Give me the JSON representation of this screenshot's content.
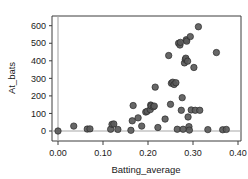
{
  "chart_data": {
    "type": "scatter",
    "title": "",
    "xlabel": "Batting_average",
    "ylabel": "At_bats",
    "xlim": [
      -0.035,
      0.425
    ],
    "ylim": [
      -45,
      645
    ],
    "xticks": [
      "0.00",
      "0.10",
      "0.20",
      "0.30",
      "0.40"
    ],
    "xtick_values": [
      0.0,
      0.1,
      0.2,
      0.3,
      0.4
    ],
    "yticks": [
      "0",
      "100",
      "200",
      "300",
      "400",
      "500",
      "600"
    ],
    "ytick_values": [
      0,
      100,
      200,
      300,
      400,
      500,
      600
    ],
    "grid": false,
    "legend": null,
    "reference_lines": {
      "vertical_x": 0.0,
      "horizontal_y": 0
    },
    "marker": {
      "shape": "circle",
      "fill": "#5a5a5a",
      "edge": "#2b2b2b",
      "size_px": 3.2
    },
    "series": [
      {
        "name": "players",
        "x": [
          0.0,
          0.035,
          0.065,
          0.071,
          0.117,
          0.12,
          0.124,
          0.133,
          0.162,
          0.165,
          0.167,
          0.178,
          0.186,
          0.195,
          0.198,
          0.205,
          0.206,
          0.207,
          0.212,
          0.214,
          0.216,
          0.222,
          0.238,
          0.246,
          0.25,
          0.252,
          0.255,
          0.258,
          0.262,
          0.265,
          0.268,
          0.271,
          0.272,
          0.274,
          0.276,
          0.278,
          0.281,
          0.283,
          0.284,
          0.285,
          0.286,
          0.288,
          0.289,
          0.291,
          0.292,
          0.294,
          0.296,
          0.302,
          0.305,
          0.312,
          0.315,
          0.333,
          0.352,
          0.366,
          0.374
        ],
        "y": [
          0,
          28,
          11,
          12,
          10,
          38,
          40,
          9,
          4,
          58,
          145,
          75,
          28,
          108,
          112,
          122,
          148,
          143,
          138,
          142,
          250,
          20,
          68,
          430,
          152,
          272,
          278,
          265,
          275,
          10,
          500,
          490,
          505,
          118,
          190,
          10,
          388,
          408,
          415,
          520,
          512,
          398,
          80,
          25,
          5,
          538,
          120,
          362,
          118,
          594,
          118,
          8,
          447,
          7,
          9
        ]
      }
    ]
  },
  "axis": {
    "x_title": "Batting_average",
    "y_title": "At_bats"
  }
}
